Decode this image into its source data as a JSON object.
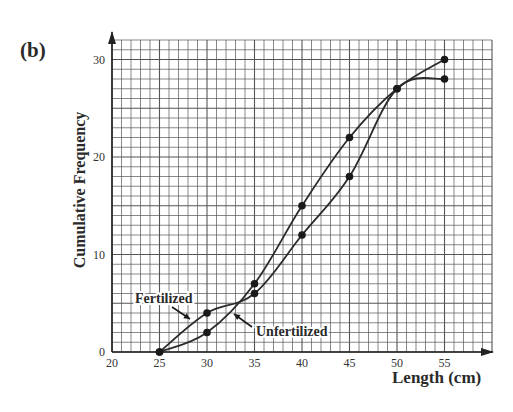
{
  "panel_label": "(b)",
  "chart_data": {
    "type": "line",
    "title": "",
    "xlabel": "Length (cm)",
    "ylabel": "Cumulative Frequency",
    "x_ticks": [
      20,
      25,
      30,
      35,
      40,
      45,
      50,
      55
    ],
    "y_ticks": [
      0,
      10,
      20,
      30
    ],
    "xlim": [
      20,
      60
    ],
    "ylim": [
      0,
      32
    ],
    "grid": true,
    "grid_minor_step": {
      "x": 1,
      "y": 1
    },
    "legend": "inline annotations with arrows",
    "series": [
      {
        "name": "Fertilized",
        "x": [
          25,
          30,
          35,
          40,
          45,
          50,
          55
        ],
        "values": [
          0,
          4,
          6,
          12,
          18,
          27,
          28
        ]
      },
      {
        "name": "Unfertilized",
        "x": [
          25,
          30,
          35,
          40,
          45,
          50,
          55
        ],
        "values": [
          0,
          2,
          7,
          15,
          22,
          27,
          30
        ]
      }
    ],
    "annotations": [
      {
        "text": "Fertilized",
        "points_to": "Fertilized"
      },
      {
        "text": "Unfertilized",
        "points_to": "Unfertilized"
      }
    ]
  },
  "colors": {
    "grid": "#555555",
    "line": "#2b2b2b",
    "text": "#2a2a2a"
  }
}
